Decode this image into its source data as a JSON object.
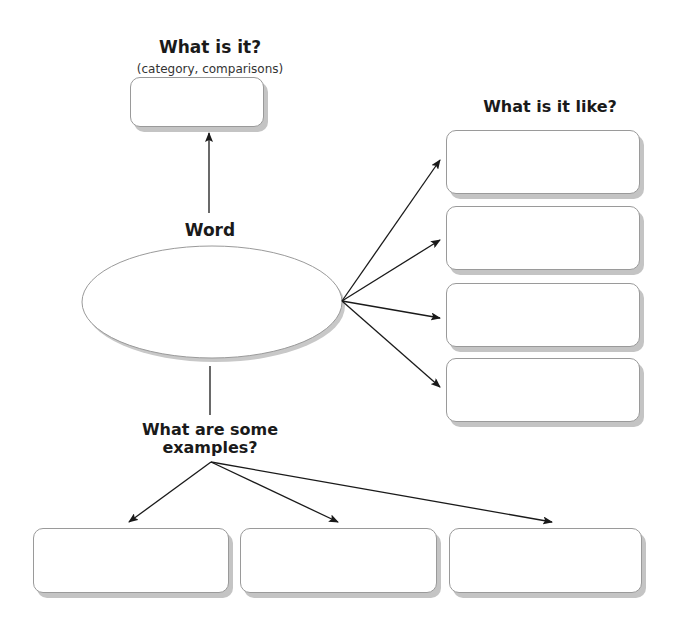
{
  "diagram": {
    "center": {
      "label": "Word"
    },
    "top": {
      "label": "What is it?",
      "sublabel": "(category, comparisons)"
    },
    "right": {
      "label": "What is it like?",
      "box_count": 4
    },
    "bottom": {
      "label_line1": "What are some",
      "label_line2": "examples?",
      "box_count": 3
    }
  },
  "colors": {
    "line": "#1a1a1a",
    "box_border": "#9a9a9a",
    "shadow": "#c4c4c4"
  }
}
